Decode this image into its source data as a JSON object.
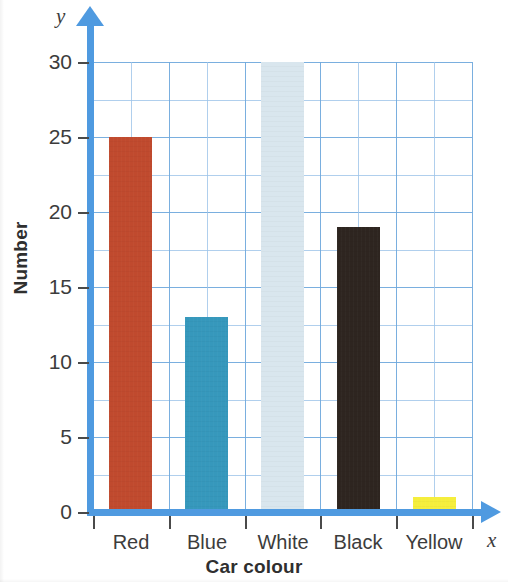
{
  "chart_data": {
    "type": "bar",
    "title": "",
    "xlabel": "Car colour",
    "ylabel": "Number",
    "x_axis_letter": "x",
    "y_axis_letter": "y",
    "categories": [
      "Red",
      "Blue",
      "White",
      "Black",
      "Yellow"
    ],
    "values": [
      25,
      13,
      30,
      19,
      1
    ],
    "bar_colors": [
      "#c04a2e",
      "#3698bc",
      "#d9e6ee",
      "#2e2520",
      "#f5ee3c"
    ],
    "ylim": [
      0,
      30
    ],
    "y_tick_labels": [
      "0",
      "5",
      "10",
      "15",
      "20",
      "25",
      "30"
    ],
    "y_tick_values": [
      0,
      5,
      10,
      15,
      20,
      25,
      30
    ],
    "y_major_step": 5,
    "y_minor_step": 2.5,
    "grid": true,
    "grid_color": "#6fa8dc",
    "axis_color": "#4f9ae0",
    "legend": "none",
    "axes_have_arrowheads": true,
    "plot_background": "#ffffff"
  },
  "axis_titles": {
    "y": "Number",
    "x": "Car colour"
  },
  "axis_letters": {
    "y": "y",
    "x": "x"
  }
}
